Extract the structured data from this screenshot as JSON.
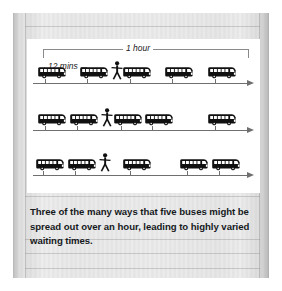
{
  "figure": {
    "hour_label": "1 hour",
    "interval_label": "12 mins",
    "icons": {
      "bus": "bus-icon",
      "person": "person-waiting-icon",
      "arrow": "axis-arrow-icon"
    },
    "rows": [
      {
        "name": "evenly-spaced-row",
        "bus_positions": [
          10,
          52,
          95,
          137,
          180
        ],
        "person_position": 84,
        "tick_positions": [
          18,
          60,
          103,
          145,
          188
        ]
      },
      {
        "name": "clustered-row",
        "bus_positions": [
          10,
          42,
          86,
          117,
          180
        ],
        "person_position": 74,
        "tick_positions": [
          18,
          50,
          94,
          125,
          188
        ]
      },
      {
        "name": "mixed-row",
        "bus_positions": [
          8,
          40,
          95,
          152,
          184
        ],
        "person_position": 72,
        "tick_positions": [
          16,
          48,
          103,
          160,
          192
        ]
      }
    ]
  },
  "caption": {
    "text": "Three of the many ways that five buses might be spread out over an hour, leading to highly varied waiting times."
  },
  "chart_data": {
    "type": "scatter",
    "xlabel": "Time (minutes)",
    "ylabel": "",
    "xlim": [
      0,
      60
    ],
    "grid": false,
    "legend": null,
    "annotations": [
      "1 hour",
      "12 mins"
    ],
    "series": [
      {
        "name": "Evenly spaced buses",
        "values": [
          0,
          12,
          24,
          36,
          48
        ]
      },
      {
        "name": "Clustered buses",
        "values": [
          0,
          9,
          21,
          30,
          48
        ]
      },
      {
        "name": "Mixed spacing buses",
        "values": [
          0,
          9,
          24,
          40,
          49
        ]
      }
    ]
  }
}
